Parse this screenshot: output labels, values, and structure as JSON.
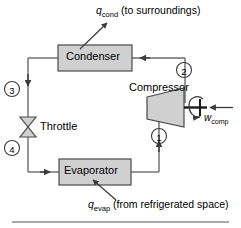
{
  "figure": {
    "type": "refrigeration-cycle-schematic",
    "background_color": "#ffffff",
    "line_color": "#6b6b6b",
    "component_fill": "#d0d0d0",
    "text_color": "#000000"
  },
  "components": {
    "condenser": {
      "label": "Condenser"
    },
    "compressor": {
      "label": "Compressor"
    },
    "throttle": {
      "label": "Throttle"
    },
    "evaporator": {
      "label": "Evaporator"
    }
  },
  "energy_flows": {
    "heat_rejected": {
      "symbol": "q",
      "subscript": "cond",
      "description": "(to surroundings)"
    },
    "heat_absorbed": {
      "symbol": "q",
      "subscript": "evap",
      "description": "(from refrigerated space)"
    },
    "work_input": {
      "symbol": "w",
      "subscript": "comp"
    }
  },
  "state_points": [
    {
      "id": "1",
      "label": "1"
    },
    {
      "id": "2",
      "label": "2"
    },
    {
      "id": "3",
      "label": "3"
    },
    {
      "id": "4",
      "label": "4"
    }
  ]
}
